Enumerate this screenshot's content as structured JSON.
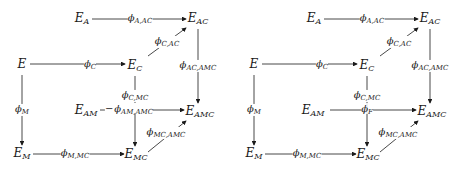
{
  "diagrams": [
    {
      "id": "left",
      "offset_x": 0,
      "nodes": {
        "E_A": {
          "base": "E",
          "sub": "A"
        },
        "E_AC": {
          "base": "E",
          "sub": "AC"
        },
        "E": {
          "base": "E",
          "sub": ""
        },
        "E_C": {
          "base": "E",
          "sub": "C"
        },
        "E_AM": {
          "base": "E",
          "sub": "AM"
        },
        "E_AMC": {
          "base": "E",
          "sub": "AMC"
        },
        "E_M": {
          "base": "E",
          "sub": "M"
        },
        "E_MC": {
          "base": "E",
          "sub": "MC"
        }
      },
      "maps": {
        "phi_A_AC": {
          "base": "ϕ",
          "sub": "A,AC"
        },
        "phi_C_AC": {
          "base": "ϕ",
          "sub": "C,AC"
        },
        "phi_C": {
          "base": "ϕ",
          "sub": "C"
        },
        "phi_AC_AMC": {
          "base": "ϕ",
          "sub": "AC,AMC"
        },
        "phi_M": {
          "base": "ϕ",
          "sub": "M"
        },
        "phi_C_MC": {
          "base": "ϕ",
          "sub": "C,MC"
        },
        "phi_AM_AMC": {
          "base": "ϕ",
          "sub": "AM,AMC"
        },
        "phi_MC_AMC": {
          "base": "ϕ",
          "sub": "MC,AMC"
        },
        "phi_M_MC": {
          "base": "ϕ",
          "sub": "M,MC"
        }
      }
    },
    {
      "id": "right",
      "offset_x": 232,
      "nodes": {
        "E_A": {
          "base": "E",
          "sub": "A"
        },
        "E_AC": {
          "base": "E",
          "sub": "AC"
        },
        "E": {
          "base": "E",
          "sub": ""
        },
        "E_C": {
          "base": "E",
          "sub": "C"
        },
        "E_AM": {
          "base": "E",
          "sub": "AM"
        },
        "E_AMC": {
          "base": "E",
          "sub": "AMC"
        },
        "E_M": {
          "base": "E",
          "sub": "M"
        },
        "E_MC": {
          "base": "E",
          "sub": "MC"
        }
      },
      "maps": {
        "phi_A_AC": {
          "base": "ϕ",
          "sub": "A,AC"
        },
        "phi_C_AC": {
          "base": "ϕ",
          "sub": "C,AC"
        },
        "phi_C": {
          "base": "ϕ",
          "sub": "C"
        },
        "phi_AC_AMC": {
          "base": "ϕ",
          "sub": "AC,AMC"
        },
        "phi_M": {
          "base": "ϕ",
          "sub": "M"
        },
        "phi_C_MC": {
          "base": "ϕ",
          "sub": "C,MC"
        },
        "phi_F": {
          "base": "ϕ",
          "sub": "F"
        },
        "phi_MC_AMC": {
          "base": "ϕ",
          "sub": "MC,AMC"
        },
        "phi_M_MC": {
          "base": "ϕ",
          "sub": "M,MC"
        }
      }
    }
  ],
  "colors": {
    "ink": "#1a1a1a",
    "background": "#ffffff"
  }
}
